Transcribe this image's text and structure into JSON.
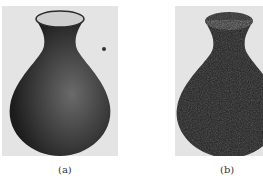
{
  "figure": {
    "panels": [
      {
        "label": "(a)",
        "description": "smooth vase rendering"
      },
      {
        "label": "(b)",
        "description": "noisy textured vase rendering"
      }
    ],
    "colors": {
      "background": "#e4e4e4",
      "vase_body": "#3a3a3a",
      "vase_mouth": "#cfcfcf",
      "noisy_body": "#1e1e1e"
    }
  }
}
